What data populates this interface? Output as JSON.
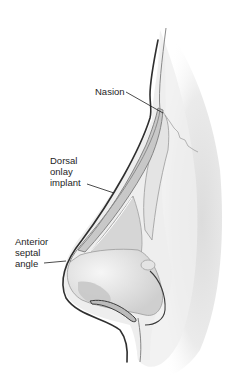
{
  "figure": {
    "colors": {
      "skin_shadow": "#e2e2e2",
      "soft_tissue": "#ececec",
      "implant": "#c8c8c8",
      "cartilage": "#d4d4d4",
      "outline_dark": "#3a3a3a",
      "outline_mid": "#8a8a8a",
      "text": "#1e1e1e"
    },
    "labels": [
      {
        "id": "nasion",
        "lines": [
          "Nasion"
        ]
      },
      {
        "id": "dorsal-onlay-implant",
        "lines": [
          "Dorsal",
          "onlay",
          "implant"
        ]
      },
      {
        "id": "anterior-septal-angle",
        "lines": [
          "Anterior",
          "septal",
          "angle"
        ]
      }
    ]
  }
}
